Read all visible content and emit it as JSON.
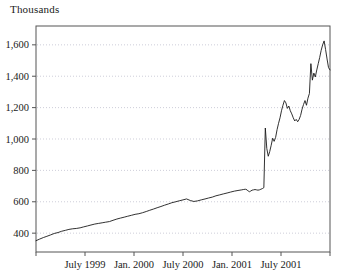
{
  "chart_data": {
    "type": "line",
    "title": "Thousands",
    "subtitle": "",
    "xlabel": "",
    "ylabel": "",
    "ylim": [
      280,
      1720
    ],
    "xlim": [
      "1999-01",
      "2001-12"
    ],
    "grid": true,
    "legend_position": "none",
    "yticks": [
      400,
      600,
      800,
      1000,
      1200,
      1400,
      1600
    ],
    "ytick_labels": [
      "400",
      "600",
      "800",
      "1,000",
      "1,200",
      "1,400",
      "1,600"
    ],
    "xticks": [
      "1999-01",
      "1999-07",
      "2000-01",
      "2000-07",
      "2001-01",
      "2001-07",
      "2002-01"
    ],
    "xtick_labels": [
      "",
      "July 1999",
      "Jan. 2000",
      "July 2000",
      "Jan. 2001",
      "July 2001",
      ""
    ],
    "series": [
      {
        "name": "Thousands",
        "color": "#1a1a1a",
        "x": [
          0.0,
          0.012,
          0.025,
          0.037,
          0.05,
          0.062,
          0.075,
          0.087,
          0.1,
          0.112,
          0.125,
          0.137,
          0.15,
          0.162,
          0.175,
          0.187,
          0.2,
          0.212,
          0.225,
          0.237,
          0.25,
          0.262,
          0.275,
          0.287,
          0.3,
          0.312,
          0.325,
          0.337,
          0.35,
          0.362,
          0.375,
          0.387,
          0.4,
          0.412,
          0.425,
          0.437,
          0.45,
          0.462,
          0.475,
          0.487,
          0.5,
          0.512,
          0.525,
          0.537,
          0.55,
          0.562,
          0.575,
          0.587,
          0.6,
          0.612,
          0.625,
          0.637,
          0.65,
          0.662,
          0.675,
          0.687,
          0.7,
          0.705,
          0.712,
          0.718,
          0.722,
          0.726,
          0.73,
          0.735,
          0.74,
          0.745,
          0.75,
          0.755,
          0.76,
          0.765,
          0.77,
          0.775,
          0.78,
          0.785,
          0.79,
          0.795,
          0.8,
          0.805,
          0.81,
          0.815,
          0.82,
          0.825,
          0.83,
          0.835,
          0.84,
          0.845,
          0.85,
          0.855,
          0.86,
          0.865,
          0.87,
          0.875,
          0.88,
          0.885,
          0.89,
          0.895,
          0.9,
          0.905,
          0.91,
          0.915,
          0.92,
          0.925,
          0.93,
          0.935,
          0.94,
          0.945,
          0.95,
          0.955,
          0.96,
          0.965,
          0.97,
          0.975,
          0.98,
          0.985,
          0.99,
          0.995,
          1.0
        ],
        "values": [
          352,
          362,
          372,
          380,
          389,
          398,
          404,
          412,
          418,
          424,
          428,
          430,
          434,
          440,
          446,
          452,
          458,
          462,
          466,
          470,
          474,
          482,
          490,
          496,
          502,
          508,
          514,
          520,
          524,
          530,
          538,
          546,
          554,
          562,
          570,
          578,
          586,
          594,
          600,
          606,
          612,
          618,
          608,
          602,
          606,
          612,
          618,
          624,
          630,
          638,
          644,
          650,
          656,
          662,
          668,
          672,
          676,
          678,
          680,
          676,
          668,
          664,
          668,
          674,
          676,
          678,
          676,
          674,
          676,
          680,
          684,
          690,
          1070,
          940,
          890,
          920,
          960,
          1005,
          985,
          1010,
          1060,
          1100,
          1135,
          1180,
          1215,
          1245,
          1230,
          1195,
          1210,
          1180,
          1160,
          1135,
          1115,
          1125,
          1110,
          1125,
          1150,
          1190,
          1220,
          1245,
          1215,
          1260,
          1290,
          1480,
          1375,
          1420,
          1395,
          1440,
          1480,
          1520,
          1565,
          1600,
          1625,
          1570,
          1510,
          1455,
          1440
        ]
      }
    ],
    "annotations": []
  },
  "axis": {
    "frame_color": "#555555",
    "grid_color": "#b9b9c9",
    "line_color": "#1a1a1a"
  }
}
